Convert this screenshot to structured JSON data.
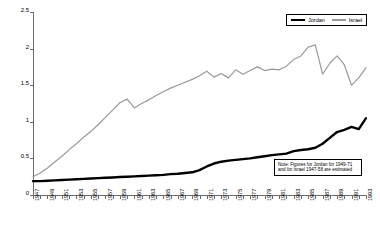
{
  "chart_data": {
    "type": "line",
    "title": "",
    "xlabel": "",
    "ylabel": "bcm / yr",
    "xlim": [
      1947,
      1993
    ],
    "ylim": [
      0,
      2.5
    ],
    "grid": false,
    "legend_position": "top-right",
    "y_ticks": [
      "0",
      "0.5",
      "1",
      "1.5",
      "2",
      "2.5"
    ],
    "y_tick_values": [
      0,
      0.5,
      1,
      1.5,
      2,
      2.5
    ],
    "x_tick_labels": [
      "1947",
      "1949",
      "1951",
      "1953",
      "1955",
      "1957",
      "1959",
      "1961",
      "1963",
      "1965",
      "1967",
      "1969",
      "1971",
      "1973",
      "1975",
      "1977",
      "1979",
      "1981",
      "1983",
      "1985",
      "1987",
      "1989",
      "1991",
      "1993"
    ],
    "x": [
      1947,
      1948,
      1949,
      1950,
      1951,
      1952,
      1953,
      1954,
      1955,
      1956,
      1957,
      1958,
      1959,
      1960,
      1961,
      1962,
      1963,
      1964,
      1965,
      1966,
      1967,
      1968,
      1969,
      1970,
      1971,
      1972,
      1973,
      1974,
      1975,
      1976,
      1977,
      1978,
      1979,
      1980,
      1981,
      1982,
      1983,
      1984,
      1985,
      1986,
      1987,
      1988,
      1989,
      1990,
      1991,
      1992,
      1993
    ],
    "series": [
      {
        "name": "Jordan",
        "color": "#000000",
        "values": [
          0.19,
          0.19,
          0.195,
          0.2,
          0.205,
          0.21,
          0.215,
          0.22,
          0.225,
          0.23,
          0.235,
          0.24,
          0.245,
          0.25,
          0.255,
          0.26,
          0.265,
          0.27,
          0.275,
          0.285,
          0.29,
          0.3,
          0.31,
          0.34,
          0.39,
          0.43,
          0.455,
          0.47,
          0.48,
          0.49,
          0.5,
          0.515,
          0.53,
          0.545,
          0.555,
          0.565,
          0.6,
          0.615,
          0.625,
          0.645,
          0.7,
          0.78,
          0.86,
          0.89,
          0.93,
          0.9,
          1.05
        ]
      },
      {
        "name": "Israel",
        "color": "#999999",
        "values": [
          0.25,
          0.3,
          0.37,
          0.45,
          0.53,
          0.62,
          0.7,
          0.79,
          0.87,
          0.96,
          1.06,
          1.16,
          1.26,
          1.31,
          1.19,
          1.25,
          1.3,
          1.36,
          1.41,
          1.46,
          1.5,
          1.54,
          1.58,
          1.63,
          1.69,
          1.61,
          1.66,
          1.6,
          1.71,
          1.65,
          1.7,
          1.75,
          1.7,
          1.72,
          1.71,
          1.76,
          1.85,
          1.9,
          2.02,
          2.05,
          1.65,
          1.8,
          1.9,
          1.78,
          1.5,
          1.6,
          1.74
        ]
      }
    ],
    "annotations": {
      "note_line1": "Note: Figures for Jordan for 1949-71",
      "note_line2": "and for Israel 1947-58 are estimated"
    }
  }
}
